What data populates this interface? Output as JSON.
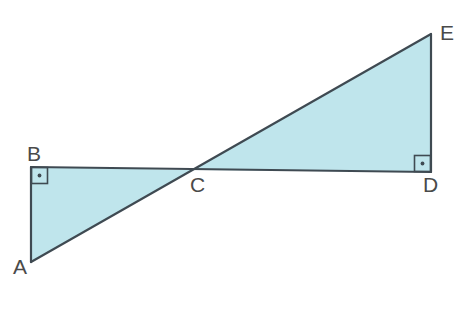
{
  "figure": {
    "background_color": "#ffffff",
    "stroke_color": "#3f4a52",
    "fill_color": "#bfe5ec",
    "stroke_width": 2.2,
    "canvas": {
      "width": 472,
      "height": 326
    }
  },
  "labels": {
    "a": "A",
    "b": "B",
    "c": "C",
    "d": "D",
    "e": "E"
  },
  "points": {
    "A": {
      "x": 31,
      "y": 262
    },
    "B": {
      "x": 31,
      "y": 167
    },
    "C": {
      "x": 192,
      "y": 170
    },
    "D": {
      "x": 431,
      "y": 172
    },
    "E": {
      "x": 431,
      "y": 34
    }
  },
  "shapes": [
    {
      "name": "triangle-abc",
      "vertices": [
        "A",
        "B",
        "C"
      ],
      "filled": true,
      "right_angle_at": "B"
    },
    {
      "name": "triangle-cde",
      "vertices": [
        "C",
        "D",
        "E"
      ],
      "filled": true,
      "right_angle_at": "D"
    }
  ],
  "segments": [
    {
      "name": "segment-bd",
      "from": "B",
      "to": "D"
    },
    {
      "name": "segment-ae",
      "from": "A",
      "to": "E"
    },
    {
      "name": "segment-ab",
      "from": "A",
      "to": "B"
    },
    {
      "name": "segment-de",
      "from": "D",
      "to": "E"
    }
  ],
  "right_angle_markers": [
    {
      "name": "right-angle-marker-b",
      "at": "B",
      "size": 17,
      "dot": true
    },
    {
      "name": "right-angle-marker-d",
      "at": "D",
      "size": 17,
      "dot": true
    }
  ]
}
